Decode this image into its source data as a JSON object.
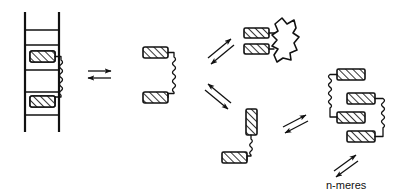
{
  "figure": {
    "caption": "n-meres",
    "background_color": "#ffffff",
    "ink_color": "#111111",
    "block_fill_color": "#ffffff",
    "hatch_color": "#111111",
    "width": 407,
    "height": 194
  },
  "states": [
    {
      "id": "state-1",
      "name": "ladder-bound-state",
      "label": "",
      "description": "ladder frame with two hatched blocks joined by a wavy linker",
      "block_count": 2,
      "rung_count": 5
    },
    {
      "id": "state-2",
      "name": "free-dimer-state",
      "label": "",
      "description": "two horizontal hatched blocks joined by a wavy linker, C-shape",
      "block_count": 2
    },
    {
      "id": "state-3",
      "name": "globule-bound-state",
      "label": "",
      "description": "two stacked hatched blocks attached to an irregular globular blob",
      "block_count": 2
    },
    {
      "id": "state-4",
      "name": "bent-dimer-state",
      "label": "",
      "description": "one vertical and one horizontal hatched block joined by a wavy linker",
      "block_count": 2
    },
    {
      "id": "state-5",
      "name": "oligomer-state",
      "label": "",
      "description": "four hatched blocks linked by wavy connectors forming an n-mer",
      "block_count": 4
    }
  ],
  "arrows": [
    {
      "id": "arrow-1",
      "name": "equilibrium-arrow-horizontal",
      "orientation": "horizontal",
      "label": ""
    },
    {
      "id": "arrow-2",
      "name": "equilibrium-arrow-up-right",
      "orientation": "diagonal-up",
      "label": ""
    },
    {
      "id": "arrow-3",
      "name": "equilibrium-arrow-down-right",
      "orientation": "diagonal-down",
      "label": ""
    },
    {
      "id": "arrow-4",
      "name": "equilibrium-arrow-right-lower",
      "orientation": "diagonal-up",
      "label": ""
    },
    {
      "id": "arrow-5",
      "name": "equilibrium-arrow-n-meres",
      "orientation": "diagonal-up",
      "label": ""
    }
  ],
  "labels": {
    "n_meres": "n-meres"
  }
}
